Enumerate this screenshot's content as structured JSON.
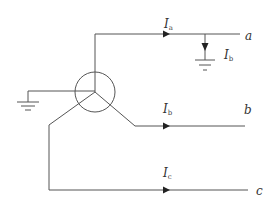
{
  "diagram": {
    "colors": {
      "line": "#555555",
      "arrow": "#222222",
      "text": "#333333"
    },
    "terminals": {
      "a": "a",
      "b": "b",
      "c": "c"
    },
    "currents": {
      "ia": {
        "symbol": "I",
        "subscript": "a"
      },
      "ib": {
        "symbol": "I",
        "subscript": "b"
      },
      "ic": {
        "symbol": "I",
        "subscript": "c"
      },
      "fault": {
        "symbol": "I",
        "subscript": "b"
      }
    },
    "components": [
      "wye-connected source (circle with three phase windings)",
      "neutral ground",
      "fault-to-ground on phase a"
    ]
  }
}
